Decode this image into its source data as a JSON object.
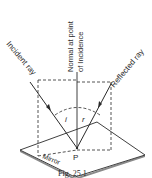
{
  "figure": {
    "caption": "Fig. 25.1",
    "labels": {
      "incident_ray": "Incident ray",
      "normal_line1": "Normal at point",
      "normal_line2": "of Incidence",
      "reflected_ray": "Reflected ray",
      "mirror": "Mirror",
      "point": "P",
      "angle_incidence": "i",
      "angle_reflection": "r"
    },
    "colors": {
      "ink": "#2a2a2a",
      "mirror_fill": "#ffffff",
      "mirror_edge": "#8a8a8a",
      "background": "#ffffff"
    }
  }
}
